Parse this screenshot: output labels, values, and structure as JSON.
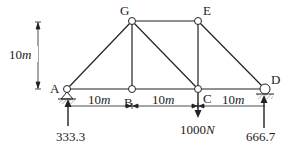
{
  "diagram": {
    "nodes": {
      "A": {
        "label": "A"
      },
      "B": {
        "label": "B"
      },
      "C": {
        "label": "C"
      },
      "D": {
        "label": "D"
      },
      "G": {
        "label": "G"
      },
      "E": {
        "label": "E"
      }
    },
    "dimensions": {
      "height": {
        "num": "10",
        "unit": "m"
      },
      "ab": {
        "num": "10",
        "unit": "m"
      },
      "bc": {
        "num": "10",
        "unit": "m"
      },
      "cd": {
        "num": "10",
        "unit": "m"
      }
    },
    "loads": {
      "c_load": {
        "num": "1000",
        "unit": "N"
      }
    },
    "reactions": {
      "a": "333.3",
      "d": "666.7"
    },
    "colors": {
      "line": "#222222",
      "hatch": "#888888"
    }
  }
}
